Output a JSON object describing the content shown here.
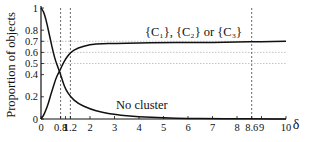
{
  "chart_data": {
    "type": "line",
    "title": "",
    "xlabel": "δ",
    "ylabel": "Proportion of objects",
    "xlim": [
      0,
      10
    ],
    "ylim": [
      0,
      1
    ],
    "x_ticks": [
      "0",
      "0.8",
      "1",
      "1.2",
      "2",
      "3",
      "4",
      "5",
      "6",
      "7",
      "8",
      "8.6",
      "9",
      "10"
    ],
    "x_tick_values": [
      0,
      0.8,
      1,
      1.2,
      2,
      3,
      4,
      5,
      6,
      7,
      8,
      8.6,
      9,
      10
    ],
    "y_ticks": [
      "0",
      "0.2",
      "0.4",
      "0.5",
      "0.6",
      "0.7",
      "0.8",
      "1"
    ],
    "y_tick_values": [
      0,
      0.2,
      0.4,
      0.5,
      0.6,
      0.7,
      0.8,
      1
    ],
    "horizontal_reference_lines": [
      0.5,
      0.6,
      0.7
    ],
    "vertical_reference_lines": [
      0.8,
      1.2,
      8.6
    ],
    "grid": false,
    "series": [
      {
        "name": "{C1}, {C2} or {C3}",
        "label": "{C₁}, {C₂} or {C₃}",
        "x": [
          0,
          0.1,
          0.2,
          0.3,
          0.4,
          0.5,
          0.6,
          0.7,
          0.8,
          0.9,
          1.0,
          1.2,
          1.5,
          2,
          2.5,
          3,
          4,
          5,
          6,
          7,
          8,
          9,
          10
        ],
        "values": [
          0.0,
          0.03,
          0.08,
          0.14,
          0.22,
          0.29,
          0.36,
          0.41,
          0.45,
          0.5,
          0.54,
          0.6,
          0.64,
          0.67,
          0.68,
          0.68,
          0.685,
          0.69,
          0.69,
          0.69,
          0.695,
          0.695,
          0.7
        ]
      },
      {
        "name": "No cluster",
        "label": "No cluster",
        "x": [
          0,
          0.1,
          0.2,
          0.3,
          0.4,
          0.5,
          0.6,
          0.7,
          0.8,
          0.9,
          1.0,
          1.2,
          1.5,
          2,
          2.5,
          3,
          4,
          5,
          6,
          7,
          8,
          9,
          10
        ],
        "values": [
          1.0,
          0.97,
          0.9,
          0.8,
          0.7,
          0.6,
          0.52,
          0.46,
          0.4,
          0.33,
          0.27,
          0.2,
          0.14,
          0.09,
          0.06,
          0.04,
          0.02,
          0.01,
          0.005,
          0.003,
          0.002,
          0.001,
          0.0
        ]
      }
    ]
  },
  "labels": {
    "ylabel": "Proportion of objects",
    "xlabel": "δ",
    "series_cluster": "{C₁}, {C₂} or {C₃}",
    "series_none": "No cluster"
  }
}
